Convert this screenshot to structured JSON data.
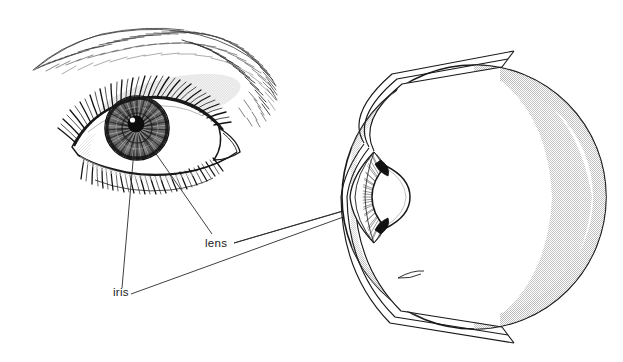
{
  "figure": {
    "background_color": "#ffffff",
    "ink_color": "#1a1a1a",
    "shade_color": "#d8d8d8",
    "width": 623,
    "height": 362
  },
  "labels": [
    {
      "id": "lens",
      "text": "lens",
      "x": 205,
      "y": 247
    },
    {
      "id": "iris",
      "text": "iris",
      "x": 113,
      "y": 296
    }
  ],
  "illustration": {
    "name": "eye-front-view-drawing",
    "description": "pen and ink rendering of a human eye with eyebrow, eyelashes, iris striations and pupil",
    "parts": [
      "eyebrow",
      "upper-eyelid",
      "lower-eyelid",
      "eyelashes",
      "sclera",
      "iris",
      "pupil",
      "tear-duct",
      "eyelid-crease"
    ]
  },
  "cross_section": {
    "name": "eye-cross-section-diagram",
    "description": "cut-away sphere showing the internal structures of the eyeball",
    "parts": [
      "sclera",
      "choroid",
      "retina",
      "cornea",
      "anterior-chamber",
      "iris",
      "ciliary-body",
      "lens",
      "vitreous-body"
    ]
  },
  "leader_lines": [
    {
      "from": "iris-label",
      "to": "eye-drawing-iris"
    },
    {
      "from": "lens-label",
      "to": "eye-drawing-lens"
    },
    {
      "from": "lens-label",
      "to": "cross-section-lens-upper"
    },
    {
      "from": "iris-label",
      "to": "cross-section-lens-lower"
    }
  ]
}
